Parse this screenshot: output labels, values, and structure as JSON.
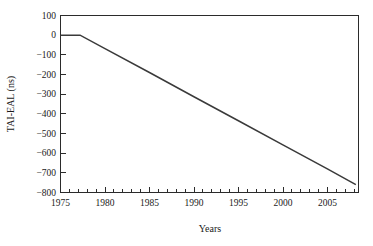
{
  "chart_data": {
    "type": "line",
    "title": "",
    "xlabel": "Years",
    "ylabel": "TAI-EAL (ns)",
    "xlim": [
      1975,
      2008.5
    ],
    "ylim": [
      -800,
      100
    ],
    "grid": false,
    "legend": false,
    "x_major_ticks": [
      1975,
      1980,
      1985,
      1990,
      1995,
      2000,
      2005
    ],
    "x_major_tick_labels": [
      "1975",
      "1980",
      "1985",
      "1990",
      "1995",
      "2000",
      "2005"
    ],
    "x_minor_tick_step": 1,
    "y_ticks": [
      100,
      0,
      -100,
      -200,
      -300,
      -400,
      -500,
      -600,
      -700,
      -800
    ],
    "y_tick_labels": [
      "100",
      "0",
      "−100",
      "−200",
      "−300",
      "−400",
      "−500",
      "−600",
      "−700",
      "−800"
    ],
    "series": [
      {
        "name": "TAI-EAL",
        "color": "#3a3a3a",
        "x": [
          1975.0,
          1977.2,
          1980,
          1985,
          1990,
          1995,
          2000,
          2005,
          2008.2
        ],
        "values": [
          0,
          0,
          -68,
          -190,
          -313,
          -435,
          -558,
          -680,
          -760
        ]
      }
    ],
    "annotations": []
  },
  "axes": {
    "y_axis_title": "TAI-EAL (ns)",
    "x_axis_title": "Years"
  }
}
